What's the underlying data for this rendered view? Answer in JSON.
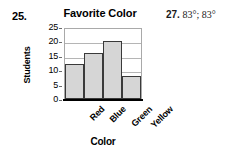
{
  "exercise": {
    "number_label": "25."
  },
  "answer_item": {
    "number_label": "27.",
    "value_text": "83°; 83°"
  },
  "chart_data": {
    "type": "bar",
    "title": "Favorite Color",
    "xlabel": "Color",
    "ylabel": "Students",
    "categories": [
      "Red",
      "Blue",
      "Green",
      "Yellow"
    ],
    "values": [
      12,
      16,
      20,
      8
    ],
    "ylim": [
      0,
      25
    ],
    "yticks": [
      25,
      20,
      15,
      10,
      5,
      0
    ],
    "ytick_labels": [
      "25",
      "20",
      "15",
      "10",
      "5",
      "0"
    ],
    "grid": true,
    "legend": null,
    "bar_fill_color": "#d6d6d6",
    "bar_edge_color": "#3a3a3a",
    "gridline_color": "#b5b5b5",
    "axis_color": "#000000"
  }
}
